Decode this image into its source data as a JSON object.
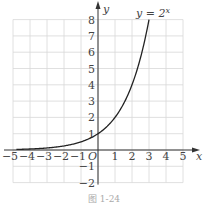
{
  "chart_data": {
    "type": "line",
    "title": "",
    "caption": "图 1-24",
    "xlabel": "x",
    "ylabel": "y",
    "origin_label": "O",
    "xlim": [
      -5,
      5
    ],
    "ylim": [
      -2,
      8
    ],
    "grid": true,
    "x_ticks": [
      -5,
      -4,
      -3,
      -2,
      -1,
      1,
      2,
      3,
      4,
      5
    ],
    "x_tick_labels": [
      "−5",
      "−4",
      "−3",
      "−2",
      "−1",
      "1",
      "2",
      "3",
      "4",
      "5"
    ],
    "y_ticks": [
      -2,
      -1,
      1,
      2,
      3,
      4,
      5,
      6,
      7,
      8
    ],
    "y_tick_labels": [
      "−2",
      "−1",
      "1",
      "2",
      "3",
      "4",
      "5",
      "6",
      "7",
      "8"
    ],
    "series": [
      {
        "name": "y = 2^x",
        "label_text": "y = 2",
        "label_sup": "x",
        "function": "2^x",
        "x": [
          -4.8,
          -4,
          -3,
          -2,
          -1,
          0,
          0.5,
          1,
          1.5,
          2,
          2.5,
          3
        ],
        "values": [
          0.036,
          0.0625,
          0.125,
          0.25,
          0.5,
          1,
          1.414,
          2,
          2.828,
          4,
          5.657,
          8
        ]
      }
    ]
  },
  "colors": {
    "grid": "#d8d8d8",
    "axis": "#333333",
    "curve": "#222222",
    "text": "#444444"
  }
}
